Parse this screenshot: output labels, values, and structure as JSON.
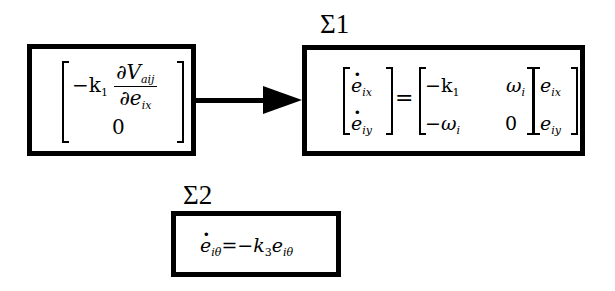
{
  "diagram": {
    "input_block": {
      "label": "",
      "row1": {
        "coef": "−k",
        "coef_sub": "1",
        "num": "∂V",
        "num_sub": "aij",
        "den": "∂e",
        "den_sub": "ix"
      },
      "row2": "0"
    },
    "sigma1": {
      "label": "Σ",
      "label_sub": "1",
      "lhs": [
        {
          "var": "e",
          "sub": "ix"
        },
        {
          "var": "e",
          "sub": "iy"
        }
      ],
      "equals": "=",
      "matrix": [
        [
          {
            "text": "−k",
            "sub": "1"
          },
          {
            "text": "ω",
            "sub": "i"
          }
        ],
        [
          {
            "text": "−ω",
            "sub": "i"
          },
          {
            "text": "0",
            "sub": ""
          }
        ]
      ],
      "rhs": [
        {
          "var": "e",
          "sub": "ix"
        },
        {
          "var": "e",
          "sub": "iy"
        }
      ]
    },
    "sigma2": {
      "label": "Σ",
      "label_sub": "2",
      "lhs_var": "e",
      "lhs_sub": "iθ",
      "equals": "=−",
      "coef": "k",
      "coef_sub": "3",
      "rhs_var": "e",
      "rhs_sub": "iθ"
    },
    "connections": [
      {
        "from": "input_block",
        "to": "sigma1",
        "style": "arrow"
      }
    ]
  }
}
